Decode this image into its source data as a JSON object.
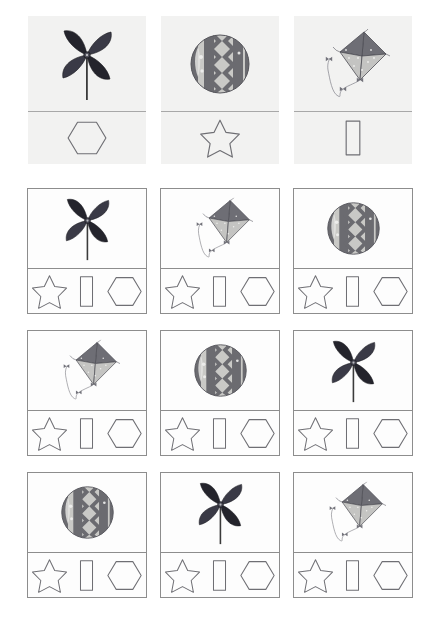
{
  "worksheet": {
    "title": "Toy to Shape Matching Worksheet",
    "background_color": "#ffffff",
    "panel_background": "#f2f2f1",
    "border_color": "#8d8d8d",
    "shape_outline_color": "#6f6f74"
  },
  "legend": {
    "name": "key-row",
    "divider_color": "#a8a8a8",
    "panels": [
      {
        "toy": "pinwheel",
        "toy_label": "Pinwheel",
        "shape": "hexagon",
        "shape_label": "Hexagon"
      },
      {
        "toy": "ball",
        "toy_label": "Ball",
        "shape": "star",
        "shape_label": "Star"
      },
      {
        "toy": "kite",
        "toy_label": "Kite",
        "shape": "rectangle",
        "shape_label": "Rectangle"
      }
    ]
  },
  "options": {
    "order": [
      "star",
      "rectangle",
      "hexagon"
    ],
    "labels": [
      "Star",
      "Rectangle",
      "Hexagon"
    ]
  },
  "grid": {
    "rows": [
      {
        "cells": [
          {
            "toy": "pinwheel",
            "toy_label": "Pinwheel",
            "answer": "hexagon"
          },
          {
            "toy": "kite",
            "toy_label": "Kite",
            "answer": "rectangle"
          },
          {
            "toy": "ball",
            "toy_label": "Ball",
            "answer": "star"
          }
        ]
      },
      {
        "cells": [
          {
            "toy": "kite",
            "toy_label": "Kite",
            "answer": "rectangle"
          },
          {
            "toy": "ball",
            "toy_label": "Ball",
            "answer": "star"
          },
          {
            "toy": "pinwheel",
            "toy_label": "Pinwheel",
            "answer": "hexagon"
          }
        ]
      },
      {
        "cells": [
          {
            "toy": "ball",
            "toy_label": "Ball",
            "answer": "star"
          },
          {
            "toy": "pinwheel",
            "toy_label": "Pinwheel",
            "answer": "hexagon"
          },
          {
            "toy": "kite",
            "toy_label": "Kite",
            "answer": "rectangle"
          }
        ]
      }
    ]
  },
  "palette": {
    "pinwheel_dark": "#24242c",
    "pinwheel_mid": "#3a3a46",
    "ball_dark": "#6b6b70",
    "ball_light": "#c9c9c6",
    "kite_dark": "#6e6e75",
    "kite_light": "#c4c4c2"
  }
}
